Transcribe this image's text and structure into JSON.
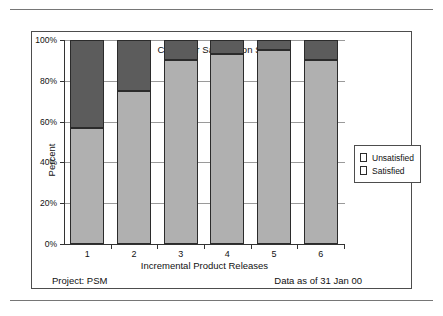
{
  "chart_data": {
    "type": "bar",
    "subtype": "stacked-100-percent",
    "title": "Customer Satisfaction Survey",
    "xlabel": "Incremental Product Releases",
    "ylabel": "Percent",
    "categories": [
      "1",
      "2",
      "3",
      "4",
      "5",
      "6"
    ],
    "ylim": [
      0,
      100
    ],
    "yticks": [
      0,
      20,
      40,
      60,
      80,
      100
    ],
    "ytick_labels": [
      "0%",
      "20%",
      "40%",
      "60%",
      "80%",
      "100%"
    ],
    "grid": "horizontal",
    "legend_position": "right",
    "series": [
      {
        "name": "Satisfied",
        "color": "#b0b0b0",
        "values": [
          57,
          75,
          90,
          93,
          95,
          90
        ]
      },
      {
        "name": "Unsatisfied",
        "color": "#5c5c5c",
        "values": [
          43,
          25,
          10,
          7,
          5,
          10
        ]
      }
    ]
  },
  "figure": {
    "title": "Customer Satisfaction Survey",
    "axis": {
      "ylabel": "Percent",
      "xlabel": "Incremental Product Releases",
      "ytick_labels": [
        "100%",
        "80%",
        "60%",
        "40%",
        "20%",
        "0%"
      ],
      "xtick_labels": [
        "1",
        "2",
        "3",
        "4",
        "5",
        "6"
      ]
    },
    "legend": {
      "items": [
        {
          "label": "Unsatisfied",
          "color": "#5c5c5c"
        },
        {
          "label": "Satisfied",
          "color": "#b0b0b0"
        }
      ]
    },
    "captions": {
      "project": "Project: PSM",
      "data_date": "Data as of 31 Jan 00"
    }
  }
}
